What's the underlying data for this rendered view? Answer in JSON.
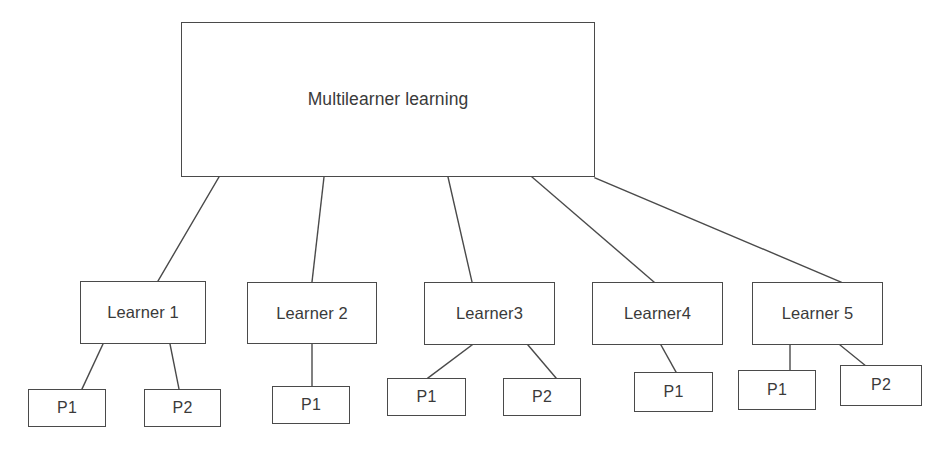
{
  "diagram": {
    "kind": "hierarchy-tree",
    "background_color": "#ffffff",
    "line_color": "#4a4a4a",
    "text_color": "#3a3a3a",
    "root": {
      "id": "root",
      "label": "Multilearner learning",
      "x": 181,
      "y": 22,
      "w": 414,
      "h": 155
    },
    "learners": [
      {
        "id": "learner-1",
        "label": "Learner 1",
        "x": 80,
        "y": 281,
        "w": 126,
        "h": 63
      },
      {
        "id": "learner-2",
        "label": "Learner 2",
        "x": 247,
        "y": 282,
        "w": 130,
        "h": 62
      },
      {
        "id": "learner-3",
        "label": "Learner3",
        "x": 424,
        "y": 282,
        "w": 131,
        "h": 63
      },
      {
        "id": "learner-4",
        "label": "Learner4",
        "x": 592,
        "y": 282,
        "w": 131,
        "h": 63
      },
      {
        "id": "learner-5",
        "label": "Learner 5",
        "x": 752,
        "y": 282,
        "w": 131,
        "h": 63
      }
    ],
    "params": [
      {
        "id": "p-l1-1",
        "parent": "learner-1",
        "label": "P1",
        "x": 28,
        "y": 389,
        "w": 78,
        "h": 38
      },
      {
        "id": "p-l1-2",
        "parent": "learner-1",
        "label": "P2",
        "x": 144,
        "y": 389,
        "w": 77,
        "h": 38
      },
      {
        "id": "p-l2-1",
        "parent": "learner-2",
        "label": "P1",
        "x": 272,
        "y": 386,
        "w": 78,
        "h": 38
      },
      {
        "id": "p-l3-1",
        "parent": "learner-3",
        "label": "P1",
        "x": 387,
        "y": 378,
        "w": 79,
        "h": 38
      },
      {
        "id": "p-l3-2",
        "parent": "learner-3",
        "label": "P2",
        "x": 503,
        "y": 378,
        "w": 78,
        "h": 38
      },
      {
        "id": "p-l4-1",
        "parent": "learner-4",
        "label": "P1",
        "x": 634,
        "y": 372,
        "w": 79,
        "h": 40
      },
      {
        "id": "p-l5-1",
        "parent": "learner-5",
        "label": "P1",
        "x": 738,
        "y": 370,
        "w": 78,
        "h": 40
      },
      {
        "id": "p-l5-2",
        "parent": "learner-5",
        "label": "P2",
        "x": 840,
        "y": 365,
        "w": 82,
        "h": 41
      }
    ],
    "edges": [
      {
        "id": "edge-root-learner-1",
        "from": "root",
        "to": "learner-1",
        "x1": 219,
        "y1": 177,
        "x2": 158,
        "y2": 281
      },
      {
        "id": "edge-root-learner-2",
        "from": "root",
        "to": "learner-2",
        "x1": 324,
        "y1": 177,
        "x2": 312,
        "y2": 282
      },
      {
        "id": "edge-root-learner-3",
        "from": "root",
        "to": "learner-3",
        "x1": 448,
        "y1": 177,
        "x2": 472,
        "y2": 282
      },
      {
        "id": "edge-root-learner-4",
        "from": "root",
        "to": "learner-4",
        "x1": 532,
        "y1": 177,
        "x2": 654,
        "y2": 282
      },
      {
        "id": "edge-root-learner-5",
        "from": "root",
        "to": "learner-5",
        "x1": 595,
        "y1": 178,
        "x2": 841,
        "y2": 282
      },
      {
        "id": "edge-learner-1-p1",
        "from": "learner-1",
        "to": "p-l1-1",
        "x1": 103,
        "y1": 344,
        "x2": 82,
        "y2": 389
      },
      {
        "id": "edge-learner-1-p2",
        "from": "learner-1",
        "to": "p-l1-2",
        "x1": 170,
        "y1": 344,
        "x2": 179,
        "y2": 389
      },
      {
        "id": "edge-learner-2-p1",
        "from": "learner-2",
        "to": "p-l2-1",
        "x1": 312,
        "y1": 344,
        "x2": 312,
        "y2": 386
      },
      {
        "id": "edge-learner-3-p1",
        "from": "learner-3",
        "to": "p-l3-1",
        "x1": 472,
        "y1": 345,
        "x2": 428,
        "y2": 378
      },
      {
        "id": "edge-learner-3-p2",
        "from": "learner-3",
        "to": "p-l3-2",
        "x1": 528,
        "y1": 345,
        "x2": 556,
        "y2": 378
      },
      {
        "id": "edge-learner-4-p1",
        "from": "learner-4",
        "to": "p-l4-1",
        "x1": 661,
        "y1": 345,
        "x2": 676,
        "y2": 372
      },
      {
        "id": "edge-learner-5-p1",
        "from": "learner-5",
        "to": "p-l5-1",
        "x1": 790,
        "y1": 345,
        "x2": 790,
        "y2": 370
      },
      {
        "id": "edge-learner-5-p2",
        "from": "learner-5",
        "to": "p-l5-2",
        "x1": 840,
        "y1": 345,
        "x2": 866,
        "y2": 366
      }
    ]
  }
}
